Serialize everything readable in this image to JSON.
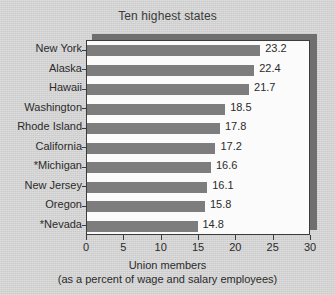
{
  "chart_data": {
    "type": "bar",
    "orientation": "horizontal",
    "title": "Ten highest states",
    "categories": [
      "New York",
      "Alaska",
      "Hawaii",
      "Washington",
      "Rhode Island",
      "California",
      "*Michigan",
      "New Jersey",
      "Oregon",
      "*Nevada"
    ],
    "values": [
      23.2,
      22.4,
      21.7,
      18.5,
      17.8,
      17.2,
      16.6,
      16.1,
      15.8,
      14.8
    ],
    "value_labels": [
      "23.2",
      "22.4",
      "21.7",
      "18.5",
      "17.8",
      "17.2",
      "16.6",
      "16.1",
      "15.8",
      "14.8"
    ],
    "xlabel": "Union members",
    "xlabel_sub": "(as a percent of wage and salary employees)",
    "ylabel": "",
    "xlim": [
      0,
      30
    ],
    "xticks": [
      0,
      5,
      10,
      15,
      20,
      25,
      30
    ],
    "xtick_labels": [
      "0",
      "5",
      "10",
      "15",
      "20",
      "25",
      "30"
    ],
    "grid": false,
    "legend": false,
    "bar_color": "#7d7d7d",
    "plot_background": "#fbfbfb",
    "page_background": "#d2d2d2",
    "axis_color": "#3c3c3c",
    "text_color": "#2b2b2b"
  }
}
